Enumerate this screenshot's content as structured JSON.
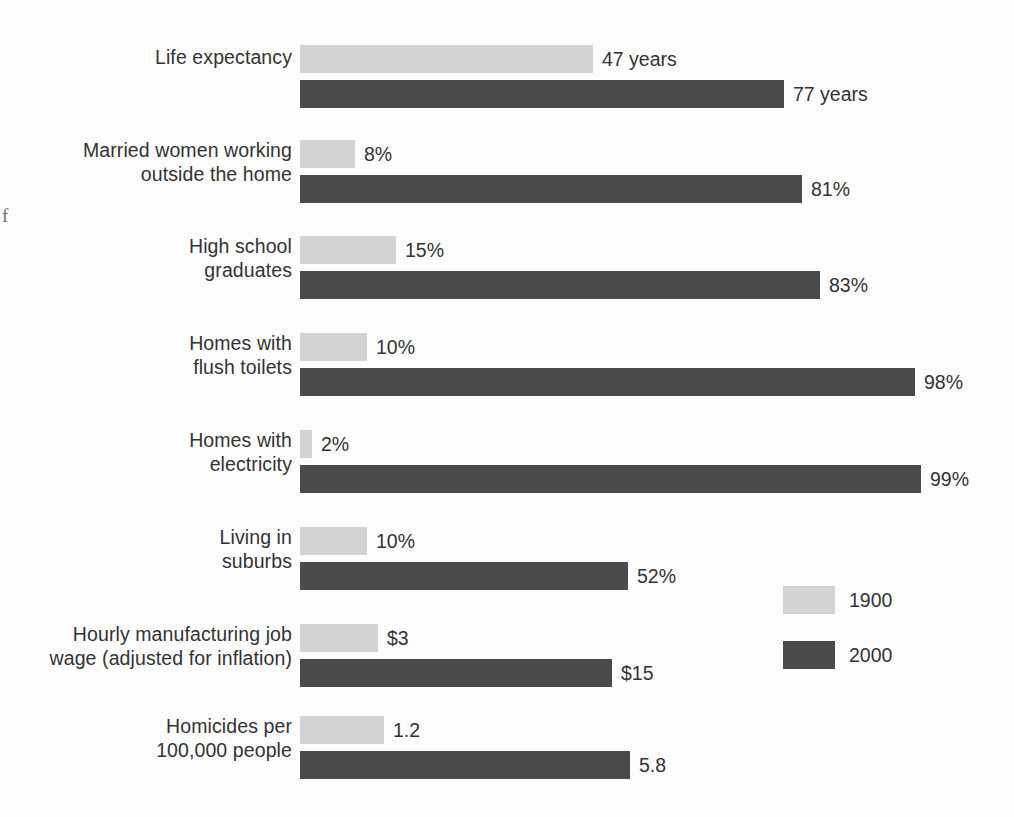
{
  "chart_data": {
    "type": "bar",
    "orientation": "horizontal",
    "title": "",
    "subtitle": "",
    "xlabel": "",
    "ylabel": "",
    "grid": false,
    "legend_position": "right-middle",
    "categories": [
      "Life expectancy",
      "Married women working outside the home",
      "High school graduates",
      "Homes with flush toilets",
      "Homes with electricity",
      "Living in suburbs",
      "Hourly manufacturing job wage (adjusted for inflation)",
      "Homicides per 100,000 people"
    ],
    "series": [
      {
        "name": "1900",
        "color": "#d3d3d3",
        "values": [
          47,
          8,
          15,
          10,
          2,
          10,
          3,
          1.2
        ],
        "value_labels": [
          "47 years",
          "8%",
          "15%",
          "10%",
          "2%",
          "10%",
          "$3",
          "1.2"
        ]
      },
      {
        "name": "2000",
        "color": "#4b4b4b",
        "values": [
          77,
          81,
          83,
          98,
          99,
          52,
          15,
          5.8
        ],
        "value_labels": [
          "77 years",
          "81%",
          "83%",
          "98%",
          "99%",
          "52%",
          "$15",
          "5.8"
        ]
      }
    ]
  },
  "rows": [
    {
      "label_lines": [
        "Life expectancy"
      ],
      "top": 45,
      "light": {
        "value_label": "47 years",
        "width": 293
      },
      "dark": {
        "value_label": "77 years",
        "width": 484
      }
    },
    {
      "label_lines": [
        "Married women working",
        "outside the home"
      ],
      "top": 140,
      "light": {
        "value_label": "8%",
        "width": 55
      },
      "dark": {
        "value_label": "81%",
        "width": 502
      }
    },
    {
      "label_lines": [
        "High school",
        "graduates"
      ],
      "top": 236,
      "light": {
        "value_label": "15%",
        "width": 96
      },
      "dark": {
        "value_label": "83%",
        "width": 520
      }
    },
    {
      "label_lines": [
        "Homes with",
        "flush toilets"
      ],
      "top": 333,
      "light": {
        "value_label": "10%",
        "width": 67
      },
      "dark": {
        "value_label": "98%",
        "width": 615
      }
    },
    {
      "label_lines": [
        "Homes with",
        "electricity"
      ],
      "top": 430,
      "light": {
        "value_label": "2%",
        "width": 12
      },
      "dark": {
        "value_label": "99%",
        "width": 621
      }
    },
    {
      "label_lines": [
        "Living in",
        "suburbs"
      ],
      "top": 527,
      "light": {
        "value_label": "10%",
        "width": 67
      },
      "dark": {
        "value_label": "52%",
        "width": 328
      }
    },
    {
      "label_lines": [
        "Hourly manufacturing job",
        "wage (adjusted for inflation)"
      ],
      "top": 624,
      "light": {
        "value_label": "$3",
        "width": 78
      },
      "dark": {
        "value_label": "$15",
        "width": 312
      }
    },
    {
      "label_lines": [
        "Homicides per",
        "100,000 people"
      ],
      "top": 716,
      "light": {
        "value_label": "1.2",
        "width": 84
      },
      "dark": {
        "value_label": "5.8",
        "width": 330
      }
    }
  ],
  "legend": {
    "items": [
      {
        "label": "1900",
        "color": "#d3d3d3"
      },
      {
        "label": "2000",
        "color": "#4b4b4b"
      }
    ]
  },
  "artifacts": {
    "stray_glyph": "f"
  },
  "colors": {
    "series_1900": "#d3d3d3",
    "series_2000": "#4b4b4b",
    "text": "#333333",
    "background": "#fdfdfd"
  }
}
